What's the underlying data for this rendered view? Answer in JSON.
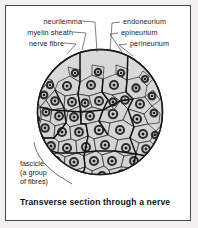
{
  "figure": {
    "caption": "Transverse section through a nerve",
    "background_color": "#f2f1ef",
    "panel_color": "#ffffff",
    "border_color": "#4a4a4a"
  },
  "labels": {
    "neurilemma": "neurilemma",
    "myelin_sheath": "myelin sheath",
    "nerve_fibre": "nerve fibre",
    "endoneurium": "endoneurium",
    "epineurium": "epineurium",
    "perineurium": "perineurium",
    "fascicle_line1": "fascicle",
    "fascicle_line2": "(a group",
    "fascicle_line3": "of fibres)"
  },
  "diagram": {
    "type": "cross-section",
    "outline_color": "#1a1a1a",
    "ground_fill": "#d9d9d9",
    "cell_fill": "#d4d4d4",
    "axon_ring_color": "#2b2b2b",
    "axon_center_color": "#1a1a1a",
    "fascicle_divider_color": "#111111",
    "circle": {
      "cx": 100,
      "cy": 112,
      "r": 63
    },
    "fascicle_count": 6,
    "fibre_count": 62
  }
}
